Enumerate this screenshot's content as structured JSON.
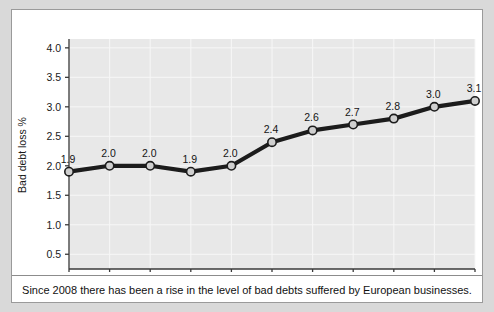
{
  "caption": "Since 2008 there has been a rise in the level of bad debts suffered by European businesses.",
  "colors": {
    "page_background": "#d9d9d9",
    "card_background": "#ffffff",
    "card_border": "#9a9a9a",
    "plot_background": "#e8e8e8",
    "gridline": "#f7f7f7",
    "series_line": "#1c1c1c",
    "marker_fill": "#cfcfcf",
    "marker_stroke": "#1c1c1c",
    "axis": "#3a3a3a",
    "text": "#111111"
  },
  "chart_data": {
    "type": "line",
    "title": "",
    "xlabel": "",
    "ylabel": "Bad debt loss %",
    "categories": [
      "2004",
      "2005",
      "2006",
      "2007",
      "2008",
      "2009",
      "2010",
      "2011",
      "2012",
      "2013",
      "2014"
    ],
    "values": [
      1.9,
      2.0,
      2.0,
      1.9,
      2.0,
      2.4,
      2.6,
      2.7,
      2.8,
      3.0,
      3.1
    ],
    "point_labels": [
      "1.9",
      "2.0",
      "2.0",
      "1.9",
      "2.0",
      "2.4",
      "2.6",
      "2.7",
      "2.8",
      "3.0",
      "3.1"
    ],
    "ylim": [
      0.25,
      4.15
    ],
    "ytick_values": [
      0.5,
      1.0,
      1.5,
      2.0,
      2.5,
      3.0,
      3.5,
      4.0
    ],
    "ytick_labels": [
      "0.5",
      "1.0",
      "1.5",
      "2.0",
      "2.5",
      "3.0",
      "3.5",
      "4.0"
    ],
    "grid": true,
    "legend": "none",
    "series_name": "Bad debt loss %"
  }
}
